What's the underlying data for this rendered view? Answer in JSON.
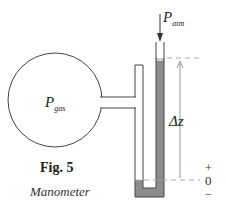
{
  "figure": {
    "number_label": "Fig. 5",
    "caption": "Manometer"
  },
  "labels": {
    "gas_pressure": {
      "symbol": "P",
      "subscript": "gas"
    },
    "atm_pressure": {
      "symbol": "P",
      "subscript": "atm"
    },
    "height_difference": "Δz",
    "scale_plus": "+",
    "scale_zero": "0",
    "scale_minus": "−"
  },
  "colors": {
    "fluid": "#8c8c8c",
    "line": "#444444",
    "dash": "#aaaaaa",
    "arrow_light": "#999999"
  }
}
